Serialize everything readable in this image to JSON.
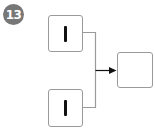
{
  "badge": {
    "number": "13",
    "color": "#777777"
  },
  "diagram": {
    "inputs": [
      {
        "id": "input-top",
        "symbol": "vertical-bar",
        "label": "|"
      },
      {
        "id": "input-bottom",
        "symbol": "vertical-bar",
        "label": "|"
      }
    ],
    "output": {
      "id": "output-empty",
      "symbol": "none",
      "label": ""
    },
    "connector": {
      "type": "merge-arrow",
      "color": "#9a9a9a",
      "arrow_color": "#111111"
    }
  }
}
